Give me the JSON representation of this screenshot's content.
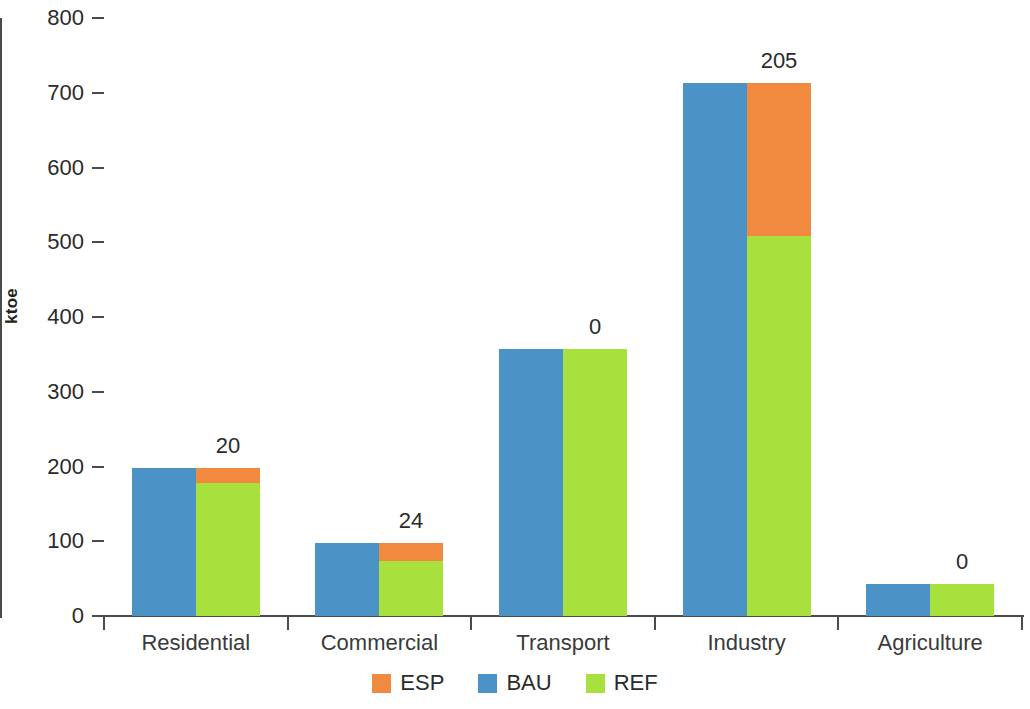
{
  "chart_data": {
    "type": "bar",
    "subtype": "grouped-with-overlay",
    "title": "",
    "xlabel": "",
    "ylabel": "ktoe",
    "ylim": [
      0,
      800
    ],
    "yticks": [
      0,
      100,
      200,
      300,
      400,
      500,
      600,
      700,
      800
    ],
    "ytick_labels": [
      "0",
      "100",
      "200",
      "300",
      "400",
      "500",
      "600",
      "700",
      "800"
    ],
    "grid": false,
    "legend_position": "bottom",
    "categories": [
      "Residential",
      "Commercial",
      "Transport",
      "Industry",
      "Agriculture"
    ],
    "series": [
      {
        "name": "BAU",
        "color": "#4b93c6",
        "values": [
          198,
          97,
          357,
          713,
          43
        ]
      },
      {
        "name": "REF",
        "color": "#a8e13e",
        "values": [
          178,
          73,
          357,
          508,
          43
        ]
      },
      {
        "name": "ESP",
        "color": "#f18a3f",
        "values": [
          20,
          24,
          0,
          205,
          0
        ]
      }
    ],
    "data_labels": [
      "20",
      "24",
      "0",
      "205",
      "0"
    ]
  },
  "legend": {
    "items": [
      {
        "label": "ESP",
        "color": "#f18a3f"
      },
      {
        "label": "BAU",
        "color": "#4b93c6"
      },
      {
        "label": "REF",
        "color": "#a8e13e"
      }
    ]
  },
  "axis": {
    "y_title": "ktoe"
  }
}
